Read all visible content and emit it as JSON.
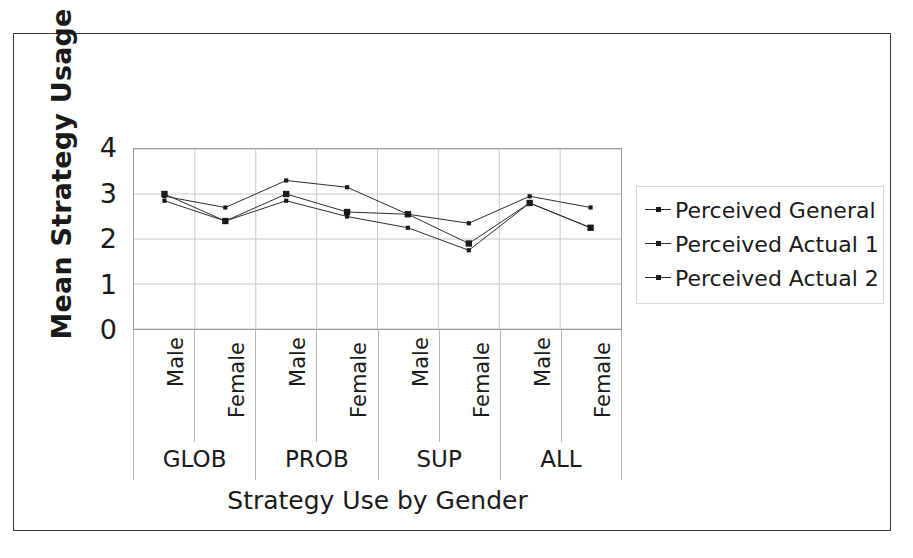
{
  "chart_data": {
    "type": "line",
    "title": "",
    "xlabel": "Strategy Use by Gender",
    "ylabel": "Mean Strategy Usage",
    "ylim": [
      0,
      4
    ],
    "yticks": [
      4,
      3,
      2,
      1,
      0
    ],
    "grid": true,
    "legend_position": "right",
    "groups": [
      "GLOB",
      "PROB",
      "SUP",
      "ALL"
    ],
    "genders": [
      "Male",
      "Female"
    ],
    "categories": [
      "GLOB Male",
      "GLOB Female",
      "PROB Male",
      "PROB Female",
      "SUP Male",
      "SUP Female",
      "ALL Male",
      "ALL Female"
    ],
    "series": [
      {
        "name": "Perceived General",
        "marker": "dot",
        "values": [
          2.95,
          2.7,
          3.3,
          3.15,
          2.55,
          2.35,
          2.95,
          2.7
        ]
      },
      {
        "name": "Perceived Actual 1",
        "marker": "square",
        "values": [
          3.0,
          2.4,
          3.0,
          2.6,
          2.55,
          1.9,
          2.8,
          2.25
        ]
      },
      {
        "name": "Perceived Actual 2",
        "marker": "dot",
        "values": [
          2.85,
          2.4,
          2.85,
          2.5,
          2.25,
          1.75,
          2.8,
          2.25
        ]
      }
    ]
  },
  "axes": {
    "y_title": "Mean Strategy Usage",
    "x_title": "Strategy Use by Gender",
    "y_ticks": [
      "4",
      "3",
      "2",
      "1",
      "0"
    ]
  },
  "x_axis": {
    "gender_labels": [
      "Male",
      "Female",
      "Male",
      "Female",
      "Male",
      "Female",
      "Male",
      "Female"
    ],
    "group_labels": [
      "GLOB",
      "PROB",
      "SUP",
      "ALL"
    ]
  },
  "legend": {
    "items": [
      {
        "label": "Perceived General"
      },
      {
        "label": "Perceived Actual 1"
      },
      {
        "label": "Perceived Actual 2"
      }
    ]
  },
  "colors": {
    "line": "#2b2b2b",
    "marker": "#1a1a1a",
    "grid": "#c8c8c8",
    "plot_border": "#9a9a9a",
    "figure_border": "#3a3a3a",
    "text": "#1a1a1a",
    "background": "#ffffff"
  }
}
